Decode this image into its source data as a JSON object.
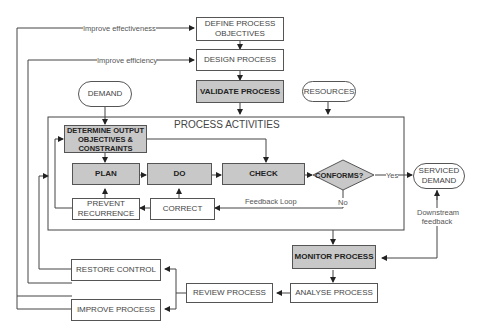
{
  "diagram": {
    "top": {
      "define_objectives": "DEFINE PROCESS OBJECTIVES",
      "design_process": "DESIGN PROCESS",
      "validate_process": "VALIDATE PROCESS"
    },
    "inputs": {
      "demand": "DEMAND",
      "resources": "RESOURCES"
    },
    "activities": {
      "title": "PROCESS ACTIVITIES",
      "determine_output": "DETERMINE OUTPUT OBJECTIVES & CONSTRAINTS",
      "plan": "PLAN",
      "do": "DO",
      "check": "CHECK",
      "conforms": "CONFORMS?",
      "prevent_recurrence": "PREVENT RECURRENCE",
      "correct": "CORRECT",
      "feedback_loop": "Feedback Loop",
      "yes": "Yes",
      "no": "No"
    },
    "output": {
      "serviced_demand": "SERVICED DEMAND",
      "downstream_feedback": "Downstream feedback"
    },
    "bottom": {
      "monitor_process": "MONITOR PROCESS",
      "analyse_process": "ANALYSE PROCESS",
      "review_process": "REVIEW PROCESS",
      "restore_control": "RESTORE CONTROL",
      "improve_process": "IMPROVE PROCESS"
    },
    "loop_labels": {
      "improve_effectiveness": "Improve effectiveness",
      "improve_efficiency": "Improve efficiency"
    },
    "colors": {
      "shaded": "#c8c8c8",
      "line": "#333333"
    }
  }
}
